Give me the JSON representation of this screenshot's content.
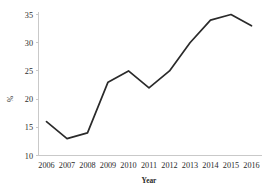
{
  "chart_data": {
    "type": "line",
    "title": "",
    "subtitle": "",
    "xlabel": "Year",
    "ylabel": "%",
    "categories": [
      "2006",
      "2007",
      "2008",
      "2009",
      "2010",
      "2011",
      "2012",
      "2013",
      "2014",
      "2015",
      "2016"
    ],
    "values": [
      16,
      13,
      14,
      23,
      25,
      22,
      25,
      30,
      34,
      35,
      33
    ],
    "series": [
      {
        "name": "%",
        "values": [
          16,
          13,
          14,
          23,
          25,
          22,
          25,
          30,
          34,
          35,
          33
        ]
      }
    ],
    "x": [
      2006,
      2007,
      2008,
      2009,
      2010,
      2011,
      2012,
      2013,
      2014,
      2015,
      2016
    ],
    "ylim": [
      10,
      35
    ],
    "yticks": [
      10,
      15,
      20,
      25,
      30,
      35
    ],
    "ytick_labels": [
      "10",
      "15",
      "20",
      "25",
      "30",
      "35"
    ],
    "xtick_labels": [
      "2006",
      "2007",
      "2008",
      "2009",
      "2010",
      "2011",
      "2012",
      "2013",
      "2014",
      "2015",
      "2016"
    ],
    "grid": false,
    "legend": false,
    "legend_position": "none",
    "annotations": [],
    "line_color": "#2a2a2a",
    "axis_color": "#c9c9c9",
    "background_color": "#ffffff"
  },
  "axis": {
    "y_title": "%",
    "x_title": "Year"
  }
}
